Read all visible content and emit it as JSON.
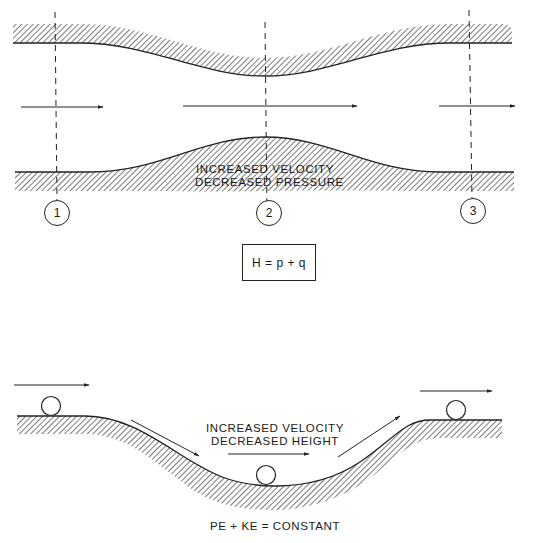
{
  "venturi": {
    "annotation_line1": "INCREASED VELOCITY",
    "annotation_line2": "DECREASED PRESSURE",
    "stations": [
      {
        "label": "1"
      },
      {
        "label": "2"
      },
      {
        "label": "3"
      }
    ],
    "equation": "H = p + q"
  },
  "rolling_ball": {
    "annotation_line1": "INCREASED VELOCITY",
    "annotation_line2": "DECREASED HEIGHT",
    "equation": "PE + KE = CONSTANT"
  },
  "colors": {
    "line": "#222222",
    "background": "#ffffff"
  }
}
